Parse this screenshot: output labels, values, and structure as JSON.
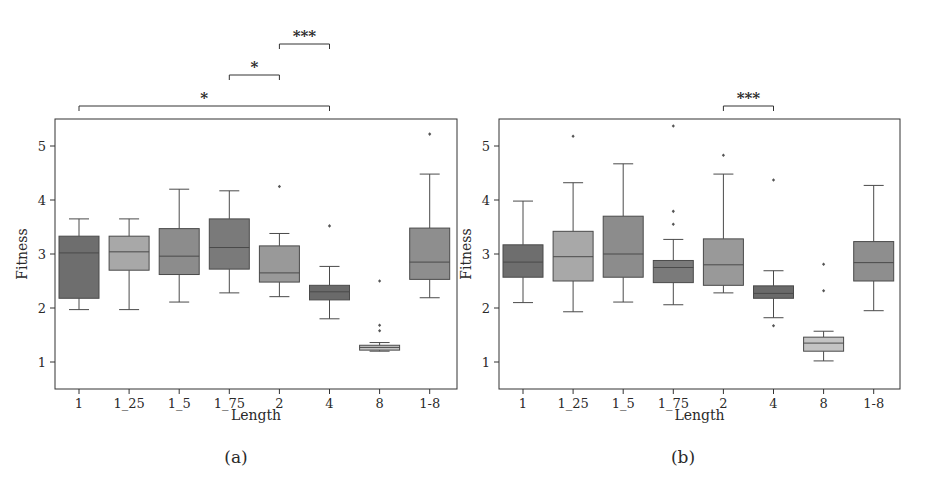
{
  "chart_data": [
    {
      "panel": "(a)",
      "type": "box",
      "title": "",
      "xlabel": "Length",
      "ylabel": "Fitness",
      "categories": [
        "1",
        "1_25",
        "1_5",
        "1_75",
        "2",
        "4",
        "8",
        "1-8"
      ],
      "yticks": [
        1,
        2,
        3,
        4,
        5
      ],
      "ylim": [
        0.5,
        5.5
      ],
      "grid": false,
      "legend": null,
      "box_colors": [
        "#6e6e6e",
        "#a8a8a8",
        "#8c8c8c",
        "#7a7a7a",
        "#999999",
        "#6a6a6a",
        "#c4c4c4",
        "#8e8e8e"
      ],
      "boxes": [
        {
          "category": "1",
          "whisker_low": 1.97,
          "q1": 2.18,
          "median": 3.02,
          "q3": 3.33,
          "whisker_high": 3.65,
          "outliers": []
        },
        {
          "category": "1_25",
          "whisker_low": 1.97,
          "q1": 2.7,
          "median": 3.04,
          "q3": 3.33,
          "whisker_high": 3.65,
          "outliers": []
        },
        {
          "category": "1_5",
          "whisker_low": 2.11,
          "q1": 2.62,
          "median": 2.96,
          "q3": 3.47,
          "whisker_high": 4.2,
          "outliers": []
        },
        {
          "category": "1_75",
          "whisker_low": 2.28,
          "q1": 2.72,
          "median": 3.12,
          "q3": 3.65,
          "whisker_high": 4.17,
          "outliers": []
        },
        {
          "category": "2",
          "whisker_low": 2.21,
          "q1": 2.48,
          "median": 2.65,
          "q3": 3.15,
          "whisker_high": 3.38,
          "outliers": [
            4.25
          ]
        },
        {
          "category": "4",
          "whisker_low": 1.8,
          "q1": 2.15,
          "median": 2.3,
          "q3": 2.42,
          "whisker_high": 2.77,
          "outliers": [
            3.52
          ]
        },
        {
          "category": "8",
          "whisker_low": 1.2,
          "q1": 1.22,
          "median": 1.27,
          "q3": 1.31,
          "whisker_high": 1.36,
          "outliers": [
            2.5,
            1.68,
            1.58
          ]
        },
        {
          "category": "1-8",
          "whisker_low": 2.19,
          "q1": 2.53,
          "median": 2.85,
          "q3": 3.48,
          "whisker_high": 4.48,
          "outliers": [
            5.22
          ]
        }
      ],
      "significance": [
        {
          "from": "2",
          "to": "4",
          "label": "***",
          "level": 3
        },
        {
          "from": "1_75",
          "to": "2",
          "label": "*",
          "level": 2
        },
        {
          "from": "1",
          "to": "4",
          "label": "*",
          "level": 1
        }
      ]
    },
    {
      "panel": "(b)",
      "type": "box",
      "title": "",
      "xlabel": "Length",
      "ylabel": "Fitness",
      "categories": [
        "1",
        "1_25",
        "1_5",
        "1_75",
        "2",
        "4",
        "8",
        "1-8"
      ],
      "yticks": [
        1,
        2,
        3,
        4,
        5
      ],
      "ylim": [
        0.5,
        5.5
      ],
      "grid": false,
      "legend": null,
      "box_colors": [
        "#6e6e6e",
        "#a8a8a8",
        "#8c8c8c",
        "#7a7a7a",
        "#999999",
        "#6a6a6a",
        "#c4c4c4",
        "#8e8e8e"
      ],
      "boxes": [
        {
          "category": "1",
          "whisker_low": 2.1,
          "q1": 2.57,
          "median": 2.85,
          "q3": 3.17,
          "whisker_high": 3.98,
          "outliers": []
        },
        {
          "category": "1_25",
          "whisker_low": 1.93,
          "q1": 2.5,
          "median": 2.95,
          "q3": 3.42,
          "whisker_high": 4.32,
          "outliers": [
            5.18
          ]
        },
        {
          "category": "1_5",
          "whisker_low": 2.11,
          "q1": 2.57,
          "median": 3.0,
          "q3": 3.7,
          "whisker_high": 4.67,
          "outliers": []
        },
        {
          "category": "1_75",
          "whisker_low": 2.06,
          "q1": 2.47,
          "median": 2.75,
          "q3": 2.88,
          "whisker_high": 3.27,
          "outliers": [
            5.37,
            3.79,
            3.55
          ]
        },
        {
          "category": "2",
          "whisker_low": 2.28,
          "q1": 2.42,
          "median": 2.8,
          "q3": 3.28,
          "whisker_high": 4.48,
          "outliers": [
            4.83
          ]
        },
        {
          "category": "4",
          "whisker_low": 1.82,
          "q1": 2.18,
          "median": 2.27,
          "q3": 2.41,
          "whisker_high": 2.69,
          "outliers": [
            4.37,
            1.67
          ]
        },
        {
          "category": "8",
          "whisker_low": 1.02,
          "q1": 1.2,
          "median": 1.35,
          "q3": 1.46,
          "whisker_high": 1.57,
          "outliers": [
            2.81,
            2.32
          ]
        },
        {
          "category": "1-8",
          "whisker_low": 1.95,
          "q1": 2.5,
          "median": 2.84,
          "q3": 3.23,
          "whisker_high": 4.27,
          "outliers": []
        }
      ],
      "significance": [
        {
          "from": "2",
          "to": "4",
          "label": "***",
          "level": 1
        }
      ]
    }
  ],
  "captions": [
    "(a)",
    "(b)"
  ]
}
